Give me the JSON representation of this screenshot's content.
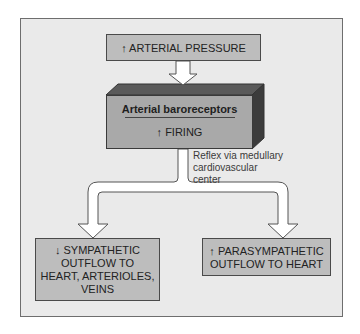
{
  "diagram": {
    "top_box": {
      "arrow": "↑",
      "label": "ARTERIAL PRESSURE"
    },
    "block": {
      "title": "Arterial baroreceptors",
      "arrow": "↑",
      "label": "FIRING"
    },
    "note": [
      "Reflex via medullary",
      "cardiovascular",
      "center"
    ],
    "left_box": {
      "arrow": "↓",
      "lines": [
        "SYMPATHETIC",
        "OUTFLOW TO",
        "HEART, ARTERIOLES,",
        "VEINS"
      ]
    },
    "right_box": {
      "arrow": "↑",
      "lines": [
        "PARASYMPATHETIC",
        "OUTFLOW TO HEART"
      ]
    },
    "colors": {
      "panel": "#eaeaea",
      "box": "#bdbdbd",
      "block_front": "#a9a9a9",
      "block_top": "#5a5a5a",
      "block_side": "#3c3c3c"
    }
  }
}
